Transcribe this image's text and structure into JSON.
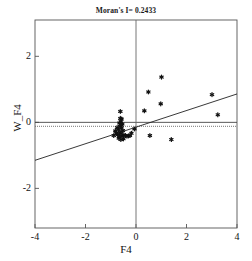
{
  "chart_data": {
    "type": "scatter",
    "title": "Moran's I= 0.2433",
    "xlabel": "F4",
    "ylabel": "W_F4",
    "xlim": [
      -4,
      4
    ],
    "ylim": [
      -3.2,
      3.1
    ],
    "xticks": [
      -4,
      -2,
      0,
      2,
      4
    ],
    "xtick_labels": [
      "-4",
      "-2",
      "0",
      "2",
      "4"
    ],
    "yticks": [
      2,
      0,
      -2
    ],
    "ytick_labels": [
      "2",
      "0",
      "-2"
    ],
    "grid": false,
    "legend": null,
    "reference_lines": {
      "horizontal_solid_y": 0,
      "horizontal_dotted_y": -0.12,
      "vertical_solid_x": 0
    },
    "trend_line": {
      "label": "regression-line",
      "x": [
        -4,
        4
      ],
      "y": [
        -1.15,
        0.86
      ]
    },
    "marker": "star",
    "marker_color": "#111111",
    "points": [
      {
        "x": -0.62,
        "y": 0.33
      },
      {
        "x": -0.57,
        "y": 0.1
      },
      {
        "x": -0.6,
        "y": 0.02
      },
      {
        "x": -0.66,
        "y": -0.02
      },
      {
        "x": -0.54,
        "y": -0.05
      },
      {
        "x": -0.63,
        "y": -0.12
      },
      {
        "x": -0.58,
        "y": -0.18
      },
      {
        "x": -0.7,
        "y": -0.22
      },
      {
        "x": -0.52,
        "y": -0.25
      },
      {
        "x": -0.64,
        "y": -0.3
      },
      {
        "x": -0.59,
        "y": -0.34
      },
      {
        "x": -0.72,
        "y": -0.37
      },
      {
        "x": -0.48,
        "y": -0.38
      },
      {
        "x": -0.55,
        "y": -0.41
      },
      {
        "x": -0.67,
        "y": -0.43
      },
      {
        "x": -0.42,
        "y": -0.4
      },
      {
        "x": -0.36,
        "y": -0.42
      },
      {
        "x": -0.3,
        "y": -0.41
      },
      {
        "x": -0.24,
        "y": -0.4
      },
      {
        "x": -0.78,
        "y": -0.33
      },
      {
        "x": -0.82,
        "y": -0.26
      },
      {
        "x": -0.75,
        "y": -0.16
      },
      {
        "x": -0.88,
        "y": -0.4
      },
      {
        "x": -0.68,
        "y": -0.48
      },
      {
        "x": -0.6,
        "y": -0.52
      },
      {
        "x": -0.5,
        "y": -0.5
      },
      {
        "x": -0.62,
        "y": 0.12
      },
      {
        "x": -0.57,
        "y": -0.09
      },
      {
        "x": 0.33,
        "y": 0.35
      },
      {
        "x": 0.49,
        "y": 0.92
      },
      {
        "x": 1.01,
        "y": 1.37
      },
      {
        "x": 0.98,
        "y": 0.56
      },
      {
        "x": 3.01,
        "y": 0.84
      },
      {
        "x": 3.24,
        "y": 0.23
      },
      {
        "x": 0.55,
        "y": -0.4
      },
      {
        "x": 1.4,
        "y": -0.52
      },
      {
        "x": -0.18,
        "y": -0.33
      },
      {
        "x": -0.06,
        "y": -0.2
      }
    ]
  }
}
